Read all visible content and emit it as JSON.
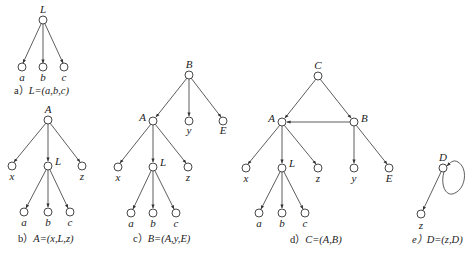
{
  "figure": {
    "panels": [
      {
        "id": "a",
        "caption_prefix": "a）",
        "caption_formula": "L=(a,b,c)",
        "nodes": {
          "L": "L",
          "a": "a",
          "b": "b",
          "c": "c"
        }
      },
      {
        "id": "b",
        "caption_prefix": "b）",
        "caption_formula": "A=(x,L,z)",
        "nodes": {
          "A": "A",
          "x": "x",
          "L": "L",
          "z": "z",
          "a": "a",
          "b": "b",
          "c": "c"
        }
      },
      {
        "id": "c",
        "caption_prefix": "c）",
        "caption_formula": "B=(A,y,E)",
        "nodes": {
          "B": "B",
          "A": "A",
          "y": "y",
          "E": "E",
          "x": "x",
          "L": "L",
          "z": "z",
          "a": "a",
          "b": "b",
          "c": "c"
        }
      },
      {
        "id": "d",
        "caption_prefix": "d）",
        "caption_formula": "C=(A,B)",
        "nodes": {
          "C": "C",
          "A": "A",
          "B": "B",
          "x": "x",
          "L": "L",
          "z": "z",
          "y": "y",
          "E": "E",
          "a": "a",
          "b": "b",
          "c": "c"
        }
      },
      {
        "id": "e",
        "caption_prefix": "e）",
        "caption_formula": "D=(z,D)",
        "nodes": {
          "D": "D",
          "z": "z"
        }
      }
    ],
    "colors": {
      "line": "#333333",
      "node_fill": "#ffffff",
      "text": "#222222"
    }
  }
}
